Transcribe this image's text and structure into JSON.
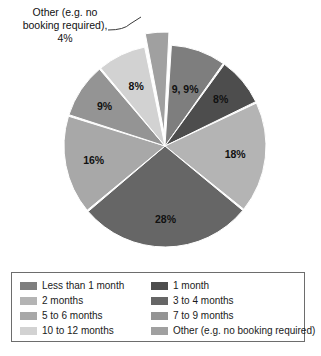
{
  "chart_data": {
    "type": "pie",
    "title": "",
    "subtitle": "",
    "xlabel": "",
    "ylabel": "",
    "legend_position": "bottom",
    "grid": false,
    "units": "percent",
    "categories": [
      "Less than 1 month",
      "1 month",
      "2 months",
      "3 to 4 months",
      "5 to 6 months",
      "7 to 9 months",
      "10 to 12 months",
      "Other (e.g. no booking required)"
    ],
    "values": [
      9,
      8,
      18,
      28,
      16,
      9,
      8,
      4
    ],
    "value_labels": [
      "9, 9%",
      "8%",
      "18%",
      "28%",
      "16%",
      "9%",
      "8%",
      "4%"
    ],
    "colors": [
      "#7e7e7e",
      "#4d4d4d",
      "#b4b4b4",
      "#666666",
      "#a8a8a8",
      "#949494",
      "#d2d2d2",
      "#a0a0a0"
    ],
    "exploded": [
      "Other (e.g. no booking required)"
    ],
    "annotations": [
      {
        "target": "Other (e.g. no booking required)",
        "lines": [
          "Other (e.g. no",
          "booking required),",
          "4%"
        ]
      }
    ],
    "slices": [
      {
        "label": "Less than 1 month",
        "value": 9,
        "value_label": "9, 9%",
        "color": "#7e7e7e",
        "exploded": false
      },
      {
        "label": "1 month",
        "value": 8,
        "value_label": "8%",
        "color": "#4d4d4d",
        "exploded": false
      },
      {
        "label": "2 months",
        "value": 18,
        "value_label": "18%",
        "color": "#b4b4b4",
        "exploded": false
      },
      {
        "label": "3 to 4 months",
        "value": 28,
        "value_label": "28%",
        "color": "#666666",
        "exploded": false
      },
      {
        "label": "5 to 6 months",
        "value": 16,
        "value_label": "16%",
        "color": "#a8a8a8",
        "exploded": false
      },
      {
        "label": "7 to 9 months",
        "value": 9,
        "value_label": "9%",
        "color": "#949494",
        "exploded": false
      },
      {
        "label": "10 to 12 months",
        "value": 8,
        "value_label": "8%",
        "color": "#d2d2d2",
        "exploded": false
      },
      {
        "label": "Other (e.g. no booking required)",
        "value": 4,
        "value_label": "4%",
        "color": "#a0a0a0",
        "exploded": true
      }
    ]
  },
  "callout": {
    "line1": "Other (e.g. no",
    "line2": "booking required),",
    "line3": "4%"
  },
  "pie_labels": {
    "l0": "9, 9%",
    "l1": "8%",
    "l2": "18%",
    "l3": "28%",
    "l4": "16%",
    "l5": "9%",
    "l6": "8%"
  },
  "legend": {
    "items": [
      {
        "label": "Less than 1 month",
        "color": "#7e7e7e"
      },
      {
        "label": "1 month",
        "color": "#4d4d4d"
      },
      {
        "label": "2 months",
        "color": "#b4b4b4"
      },
      {
        "label": "3 to 4 months",
        "color": "#666666"
      },
      {
        "label": "5 to 6 months",
        "color": "#a8a8a8"
      },
      {
        "label": "7 to 9 months",
        "color": "#949494"
      },
      {
        "label": "10 to 12 months",
        "color": "#d2d2d2"
      },
      {
        "label": "Other (e.g. no booking required)",
        "color": "#a0a0a0"
      }
    ],
    "order": [
      0,
      1,
      2,
      3,
      4,
      5,
      6,
      7
    ],
    "border_color": "#6d6d6d"
  }
}
